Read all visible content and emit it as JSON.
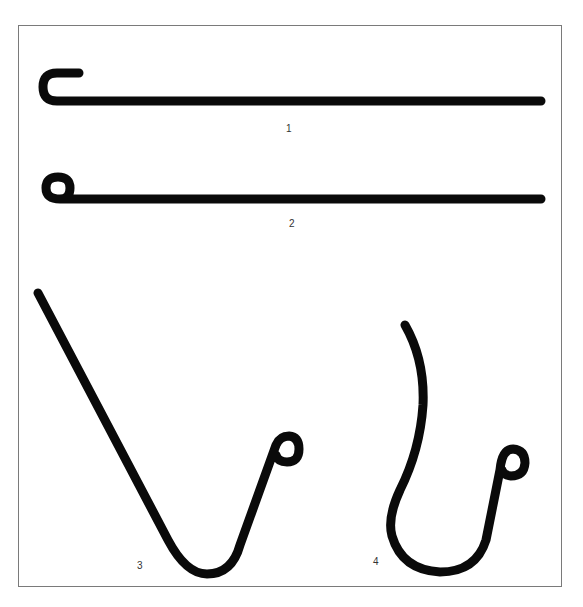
{
  "figure": {
    "type": "line-drawing",
    "stroke_color": "#0a0a0a",
    "frame_color": "#7a7a7a",
    "background": "#ffffff",
    "shapes": [
      {
        "id": "1",
        "label": "1",
        "description": "straight wire with open J-bend at left end"
      },
      {
        "id": "2",
        "label": "2",
        "description": "straight wire with closed eye loop at left end"
      },
      {
        "id": "3",
        "label": "3",
        "description": "V-shaped hook with long straight arm and small eye loop"
      },
      {
        "id": "4",
        "label": "4",
        "description": "curved S-shaped hook with small eye loop"
      }
    ]
  }
}
